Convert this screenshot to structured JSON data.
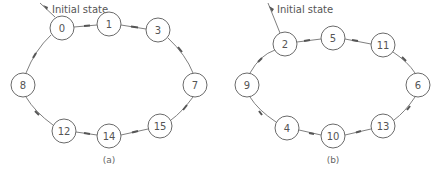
{
  "diagram_a": {
    "caption": "(a)",
    "initial_label": "Initial state",
    "nodes": [
      {
        "label": "0",
        "x": 62,
        "y": 28
      },
      {
        "label": "1",
        "x": 109,
        "y": 24
      },
      {
        "label": "3",
        "x": 158,
        "y": 30
      },
      {
        "label": "7",
        "x": 195,
        "y": 85
      },
      {
        "label": "15",
        "x": 160,
        "y": 126
      },
      {
        "label": "14",
        "x": 109,
        "y": 136
      },
      {
        "label": "12",
        "x": 64,
        "y": 131
      },
      {
        "label": "8",
        "x": 23,
        "y": 85
      }
    ],
    "cycle": [
      "0",
      "1",
      "3",
      "7",
      "15",
      "14",
      "12",
      "8",
      "0"
    ]
  },
  "diagram_b": {
    "caption": "(b)",
    "initial_label": "Initial state",
    "nodes": [
      {
        "label": "2",
        "x": 285,
        "y": 44
      },
      {
        "label": "5",
        "x": 333,
        "y": 38
      },
      {
        "label": "11",
        "x": 383,
        "y": 45
      },
      {
        "label": "6",
        "x": 418,
        "y": 85
      },
      {
        "label": "13",
        "x": 383,
        "y": 126
      },
      {
        "label": "10",
        "x": 333,
        "y": 136
      },
      {
        "label": "4",
        "x": 287,
        "y": 128
      },
      {
        "label": "9",
        "x": 247,
        "y": 85
      }
    ],
    "cycle": [
      "2",
      "5",
      "11",
      "6",
      "13",
      "10",
      "4",
      "9",
      "2"
    ]
  },
  "colors": {
    "stroke": "#6a6a6a",
    "text": "#555555",
    "background": "#ffffff"
  }
}
